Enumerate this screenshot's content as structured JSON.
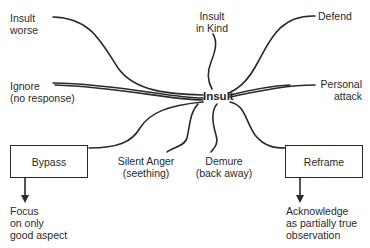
{
  "diagram": {
    "center": {
      "label": "Insult"
    },
    "responses": {
      "insult_worse": {
        "line1": "Insult",
        "line2": "worse"
      },
      "insult_in_kind": {
        "line1": "Insult",
        "line2": "in Kind"
      },
      "defend": {
        "line1": "Defend"
      },
      "ignore": {
        "line1": "Ignore",
        "line2": "(no response)"
      },
      "personal_attack": {
        "line1": "Personal",
        "line2": "attack"
      },
      "silent_anger": {
        "line1": "Silent Anger",
        "line2": "(seething)"
      },
      "demure": {
        "line1": "Demure",
        "line2": "(back away)"
      }
    },
    "boxes": {
      "bypass": {
        "label": "Bypass",
        "outcome": {
          "line1": "Focus",
          "line2": "on only",
          "line3": "good aspect"
        }
      },
      "reframe": {
        "label": "Reframe",
        "outcome": {
          "line1": "Acknowledge",
          "line2": "as partially true",
          "line3": "observation"
        }
      }
    },
    "colors": {
      "line": "#2a2a2a",
      "background": "#ffffff",
      "text": "#2a2a2a"
    }
  }
}
